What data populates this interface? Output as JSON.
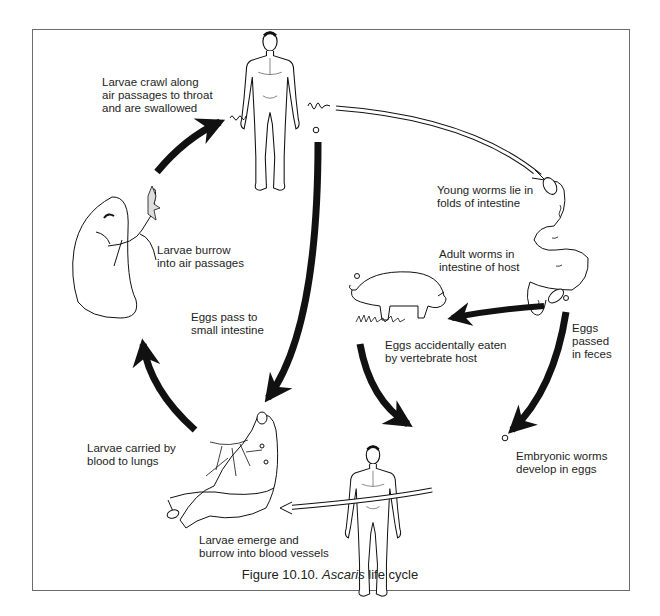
{
  "figure": {
    "caption_prefix": "Figure 10.10. ",
    "caption_italic": "Ascaris",
    "caption_suffix": " life cycle"
  },
  "labels": {
    "larvae_crawl": "Larvae crawl along\nair passages to throat\nand are swallowed",
    "larvae_burrow": "Larvae burrow\ninto air passages",
    "eggs_pass": "Eggs pass to\nsmall intestine",
    "young_worms": "Young worms lie in\nfolds of intestine",
    "adult_worms": "Adult worms in\nintestine of host",
    "eggs_eaten": "Eggs accidentally eaten\nby vertebrate host",
    "eggs_passed": "Eggs\npassed\nin feces",
    "embryonic": "Embryonic worms\ndevelop in eggs",
    "larvae_carried": "Larvae carried by\nblood to lungs",
    "larvae_emerge": "Larvae emerge and\nburrow into blood vessels"
  },
  "nodes": [
    {
      "id": "human-top",
      "icon": "human-figure-icon"
    },
    {
      "id": "intestine-right",
      "icon": "intestine-icon"
    },
    {
      "id": "pig",
      "icon": "pig-icon"
    },
    {
      "id": "human-bottom",
      "icon": "human-figure-icon"
    },
    {
      "id": "intestine-bottom",
      "icon": "intestine-blood-vessels-icon"
    },
    {
      "id": "lung",
      "icon": "lung-icon"
    }
  ],
  "colors": {
    "ink": "#111111",
    "frame": "#6b6b6b",
    "background": "#ffffff"
  }
}
